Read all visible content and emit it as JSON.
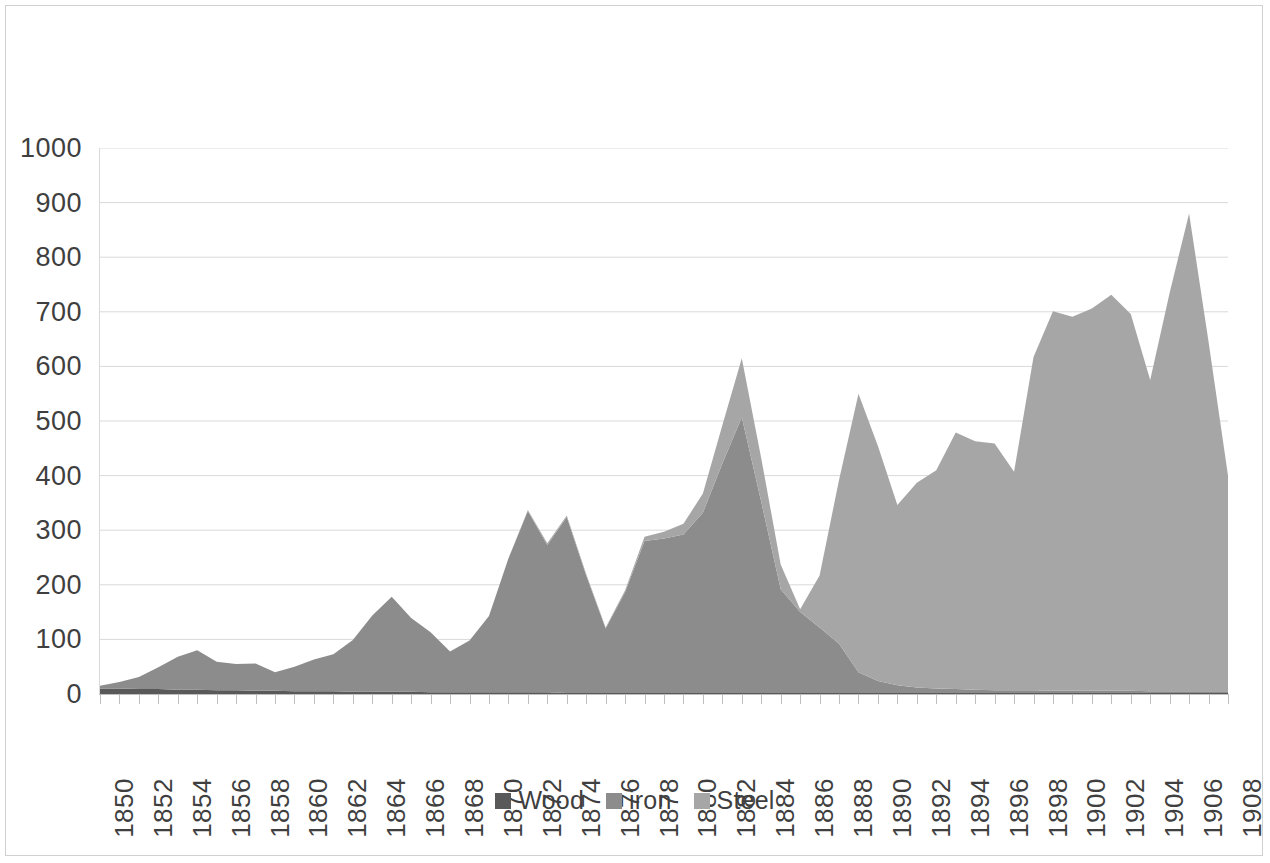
{
  "chart_data": {
    "type": "area",
    "stacked": true,
    "title": "",
    "subtitle": "",
    "xlabel": "",
    "ylabel": "",
    "ylim": [
      0,
      1000
    ],
    "xlim": [
      1850,
      1908
    ],
    "y_ticks": [
      0,
      100,
      200,
      300,
      400,
      500,
      600,
      700,
      800,
      900,
      1000
    ],
    "y_tick_labels": [
      "0",
      "100",
      "200",
      "300",
      "400",
      "500",
      "600",
      "700",
      "800",
      "900",
      "1000"
    ],
    "grid": "horizontal",
    "legend_position": "bottom",
    "x": [
      1850,
      1851,
      1852,
      1853,
      1854,
      1855,
      1856,
      1857,
      1858,
      1859,
      1860,
      1861,
      1862,
      1863,
      1864,
      1865,
      1866,
      1867,
      1868,
      1869,
      1870,
      1871,
      1872,
      1873,
      1874,
      1875,
      1876,
      1877,
      1878,
      1879,
      1880,
      1881,
      1882,
      1883,
      1884,
      1885,
      1886,
      1887,
      1888,
      1889,
      1890,
      1891,
      1892,
      1893,
      1894,
      1895,
      1896,
      1897,
      1898,
      1899,
      1900,
      1901,
      1902,
      1903,
      1904,
      1905,
      1906,
      1907,
      1908
    ],
    "x_tick_labels": [
      "1850",
      "1852",
      "1854",
      "1856",
      "1858",
      "1860",
      "1862",
      "1864",
      "1866",
      "1868",
      "1870",
      "1872",
      "1874",
      "1876",
      "1878",
      "1880",
      "1882",
      "1884",
      "1886",
      "1888",
      "1890",
      "1892",
      "1894",
      "1896",
      "1898",
      "1900",
      "1902",
      "1904",
      "1906",
      "1908"
    ],
    "series": [
      {
        "name": "Wood",
        "color": "#595959",
        "values": [
          10,
          10,
          9,
          9,
          8,
          8,
          7,
          7,
          6,
          6,
          5,
          5,
          5,
          4,
          4,
          4,
          4,
          3,
          3,
          3,
          3,
          3,
          3,
          3,
          2,
          2,
          2,
          2,
          2,
          2,
          2,
          2,
          2,
          2,
          2,
          2,
          2,
          2,
          2,
          2,
          2,
          2,
          2,
          2,
          2,
          2,
          2,
          2,
          2,
          2,
          2,
          2,
          2,
          2,
          2,
          2,
          2,
          2,
          2
        ]
      },
      {
        "name": "iron",
        "color": "#8c8c8c",
        "values": [
          5,
          12,
          22,
          40,
          60,
          72,
          52,
          48,
          50,
          34,
          45,
          58,
          68,
          95,
          140,
          174,
          135,
          110,
          75,
          95,
          140,
          245,
          332,
          270,
          322,
          215,
          118,
          185,
          278,
          283,
          290,
          330,
          420,
          505,
          350,
          190,
          148,
          120,
          90,
          38,
          22,
          14,
          10,
          8,
          7,
          6,
          5,
          5,
          5,
          4,
          4,
          4,
          4,
          4,
          3,
          3,
          3,
          3,
          3
        ]
      },
      {
        "name": "Steel",
        "color": "#a6a6a6",
        "values": [
          0,
          0,
          0,
          0,
          0,
          0,
          0,
          0,
          0,
          0,
          0,
          0,
          0,
          0,
          0,
          0,
          0,
          0,
          0,
          0,
          0,
          0,
          2,
          3,
          3,
          3,
          2,
          3,
          8,
          12,
          20,
          35,
          70,
          108,
          80,
          45,
          5,
          95,
          300,
          510,
          430,
          330,
          375,
          400,
          470,
          455,
          452,
          400,
          610,
          695,
          685,
          700,
          725,
          690,
          570,
          730,
          875,
          640,
          395
        ]
      }
    ]
  },
  "legend": {
    "items": [
      {
        "label": "Wood",
        "color": "#595959"
      },
      {
        "label": "iron",
        "color": "#8c8c8c"
      },
      {
        "label": "Steel",
        "color": "#a6a6a6"
      }
    ]
  }
}
